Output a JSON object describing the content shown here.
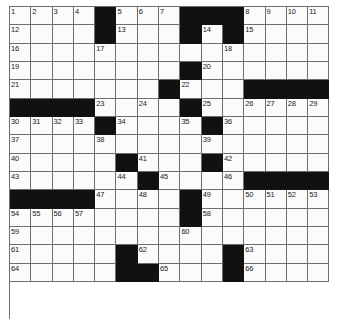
{
  "puzzle": {
    "title": "Crossword Grid",
    "columns": 15,
    "rows": 17,
    "colors": {
      "block": "#111111",
      "cell": "#fbfbfb",
      "gridline": "#6e6e6e",
      "number": "#1a1a1a",
      "background": "#ffffff"
    },
    "grid": [
      {
        "row": 1,
        "cells": [
          {
            "type": "open",
            "number": "1"
          },
          {
            "type": "open",
            "number": "2"
          },
          {
            "type": "open",
            "number": "3"
          },
          {
            "type": "open",
            "number": "4"
          },
          {
            "type": "block",
            "number": ""
          },
          {
            "type": "open",
            "number": "5"
          },
          {
            "type": "open",
            "number": "6"
          },
          {
            "type": "open",
            "number": "7"
          },
          {
            "type": "block",
            "number": ""
          },
          {
            "type": "block",
            "number": ""
          },
          {
            "type": "block",
            "number": ""
          },
          {
            "type": "open",
            "number": "8"
          },
          {
            "type": "open",
            "number": "9"
          },
          {
            "type": "open",
            "number": "10"
          },
          {
            "type": "open",
            "number": "11"
          }
        ]
      },
      {
        "row": 2,
        "cells": [
          {
            "type": "open",
            "number": "12"
          },
          {
            "type": "open",
            "number": ""
          },
          {
            "type": "open",
            "number": ""
          },
          {
            "type": "open",
            "number": ""
          },
          {
            "type": "block",
            "number": ""
          },
          {
            "type": "open",
            "number": "13"
          },
          {
            "type": "open",
            "number": ""
          },
          {
            "type": "open",
            "number": ""
          },
          {
            "type": "block",
            "number": ""
          },
          {
            "type": "open",
            "number": "14"
          },
          {
            "type": "block",
            "number": ""
          },
          {
            "type": "open",
            "number": "15"
          },
          {
            "type": "open",
            "number": ""
          },
          {
            "type": "open",
            "number": ""
          },
          {
            "type": "open",
            "number": ""
          }
        ]
      },
      {
        "row": 3,
        "cells": [
          {
            "type": "open",
            "number": "16"
          },
          {
            "type": "open",
            "number": ""
          },
          {
            "type": "open",
            "number": ""
          },
          {
            "type": "open",
            "number": ""
          },
          {
            "type": "open",
            "number": "17"
          },
          {
            "type": "open",
            "number": ""
          },
          {
            "type": "open",
            "number": ""
          },
          {
            "type": "open",
            "number": ""
          },
          {
            "type": "open",
            "number": ""
          },
          {
            "type": "open",
            "number": ""
          },
          {
            "type": "open",
            "number": "18"
          },
          {
            "type": "open",
            "number": ""
          },
          {
            "type": "open",
            "number": ""
          },
          {
            "type": "open",
            "number": ""
          },
          {
            "type": "open",
            "number": ""
          }
        ]
      },
      {
        "row": 4,
        "cells": [
          {
            "type": "open",
            "number": "19"
          },
          {
            "type": "open",
            "number": ""
          },
          {
            "type": "open",
            "number": ""
          },
          {
            "type": "open",
            "number": ""
          },
          {
            "type": "open",
            "number": ""
          },
          {
            "type": "open",
            "number": ""
          },
          {
            "type": "open",
            "number": ""
          },
          {
            "type": "open",
            "number": ""
          },
          {
            "type": "block",
            "number": ""
          },
          {
            "type": "open",
            "number": "20"
          },
          {
            "type": "open",
            "number": ""
          },
          {
            "type": "open",
            "number": ""
          },
          {
            "type": "open",
            "number": ""
          },
          {
            "type": "open",
            "number": ""
          },
          {
            "type": "open",
            "number": ""
          }
        ]
      },
      {
        "row": 5,
        "cells": [
          {
            "type": "open",
            "number": "21"
          },
          {
            "type": "open",
            "number": ""
          },
          {
            "type": "open",
            "number": ""
          },
          {
            "type": "open",
            "number": ""
          },
          {
            "type": "open",
            "number": ""
          },
          {
            "type": "open",
            "number": ""
          },
          {
            "type": "open",
            "number": ""
          },
          {
            "type": "block",
            "number": ""
          },
          {
            "type": "open",
            "number": "22"
          },
          {
            "type": "open",
            "number": ""
          },
          {
            "type": "open",
            "number": ""
          },
          {
            "type": "block",
            "number": ""
          },
          {
            "type": "block",
            "number": ""
          },
          {
            "type": "block",
            "number": ""
          },
          {
            "type": "block",
            "number": ""
          }
        ]
      },
      {
        "row": 6,
        "cells": [
          {
            "type": "block",
            "number": ""
          },
          {
            "type": "block",
            "number": ""
          },
          {
            "type": "block",
            "number": ""
          },
          {
            "type": "block",
            "number": ""
          },
          {
            "type": "open",
            "number": "23"
          },
          {
            "type": "open",
            "number": ""
          },
          {
            "type": "open",
            "number": "24"
          },
          {
            "type": "open",
            "number": ""
          },
          {
            "type": "block",
            "number": ""
          },
          {
            "type": "open",
            "number": "25"
          },
          {
            "type": "open",
            "number": ""
          },
          {
            "type": "open",
            "number": "26"
          },
          {
            "type": "open",
            "number": "27"
          },
          {
            "type": "open",
            "number": "28"
          },
          {
            "type": "open",
            "number": "29"
          }
        ]
      },
      {
        "row": 7,
        "cells": [
          {
            "type": "open",
            "number": "30"
          },
          {
            "type": "open",
            "number": "31"
          },
          {
            "type": "open",
            "number": "32"
          },
          {
            "type": "open",
            "number": "33"
          },
          {
            "type": "block",
            "number": ""
          },
          {
            "type": "open",
            "number": "34"
          },
          {
            "type": "open",
            "number": ""
          },
          {
            "type": "open",
            "number": ""
          },
          {
            "type": "open",
            "number": "35"
          },
          {
            "type": "block",
            "number": ""
          },
          {
            "type": "open",
            "number": "36"
          },
          {
            "type": "open",
            "number": ""
          },
          {
            "type": "open",
            "number": ""
          },
          {
            "type": "open",
            "number": ""
          },
          {
            "type": "open",
            "number": ""
          }
        ]
      },
      {
        "row": 8,
        "cells": [
          {
            "type": "open",
            "number": "37"
          },
          {
            "type": "open",
            "number": ""
          },
          {
            "type": "open",
            "number": ""
          },
          {
            "type": "open",
            "number": ""
          },
          {
            "type": "open",
            "number": "38"
          },
          {
            "type": "open",
            "number": ""
          },
          {
            "type": "open",
            "number": ""
          },
          {
            "type": "open",
            "number": ""
          },
          {
            "type": "open",
            "number": ""
          },
          {
            "type": "open",
            "number": "39"
          },
          {
            "type": "open",
            "number": ""
          },
          {
            "type": "open",
            "number": ""
          },
          {
            "type": "open",
            "number": ""
          },
          {
            "type": "open",
            "number": ""
          },
          {
            "type": "open",
            "number": ""
          }
        ]
      },
      {
        "row": 9,
        "cells": [
          {
            "type": "open",
            "number": "40"
          },
          {
            "type": "open",
            "number": ""
          },
          {
            "type": "open",
            "number": ""
          },
          {
            "type": "open",
            "number": ""
          },
          {
            "type": "open",
            "number": ""
          },
          {
            "type": "block",
            "number": ""
          },
          {
            "type": "open",
            "number": "41"
          },
          {
            "type": "open",
            "number": ""
          },
          {
            "type": "open",
            "number": ""
          },
          {
            "type": "block",
            "number": ""
          },
          {
            "type": "open",
            "number": "42"
          },
          {
            "type": "open",
            "number": ""
          },
          {
            "type": "open",
            "number": ""
          },
          {
            "type": "open",
            "number": ""
          },
          {
            "type": "open",
            "number": ""
          }
        ]
      },
      {
        "row": 10,
        "cells": [
          {
            "type": "open",
            "number": "43"
          },
          {
            "type": "open",
            "number": ""
          },
          {
            "type": "open",
            "number": ""
          },
          {
            "type": "open",
            "number": ""
          },
          {
            "type": "open",
            "number": ""
          },
          {
            "type": "open",
            "number": "44"
          },
          {
            "type": "block",
            "number": ""
          },
          {
            "type": "open",
            "number": "45"
          },
          {
            "type": "open",
            "number": ""
          },
          {
            "type": "open",
            "number": ""
          },
          {
            "type": "open",
            "number": "46"
          },
          {
            "type": "block",
            "number": ""
          },
          {
            "type": "block",
            "number": ""
          },
          {
            "type": "block",
            "number": ""
          },
          {
            "type": "block",
            "number": ""
          }
        ]
      },
      {
        "row": 11,
        "cells": [
          {
            "type": "block",
            "number": ""
          },
          {
            "type": "block",
            "number": ""
          },
          {
            "type": "block",
            "number": ""
          },
          {
            "type": "block",
            "number": ""
          },
          {
            "type": "open",
            "number": "47"
          },
          {
            "type": "open",
            "number": ""
          },
          {
            "type": "open",
            "number": "48"
          },
          {
            "type": "open",
            "number": ""
          },
          {
            "type": "block",
            "number": ""
          },
          {
            "type": "open",
            "number": "49"
          },
          {
            "type": "open",
            "number": ""
          },
          {
            "type": "open",
            "number": "50"
          },
          {
            "type": "open",
            "number": "51"
          },
          {
            "type": "open",
            "number": "52"
          },
          {
            "type": "open",
            "number": "53"
          }
        ]
      },
      {
        "row": 12,
        "cells": [
          {
            "type": "open",
            "number": "54"
          },
          {
            "type": "open",
            "number": "55"
          },
          {
            "type": "open",
            "number": "56"
          },
          {
            "type": "open",
            "number": "57"
          },
          {
            "type": "open",
            "number": ""
          },
          {
            "type": "open",
            "number": ""
          },
          {
            "type": "open",
            "number": ""
          },
          {
            "type": "open",
            "number": ""
          },
          {
            "type": "block",
            "number": ""
          },
          {
            "type": "open",
            "number": "58"
          },
          {
            "type": "open",
            "number": ""
          },
          {
            "type": "open",
            "number": ""
          },
          {
            "type": "open",
            "number": ""
          },
          {
            "type": "open",
            "number": ""
          },
          {
            "type": "open",
            "number": ""
          }
        ]
      },
      {
        "row": 13,
        "cells": [
          {
            "type": "open",
            "number": "59"
          },
          {
            "type": "open",
            "number": ""
          },
          {
            "type": "open",
            "number": ""
          },
          {
            "type": "open",
            "number": ""
          },
          {
            "type": "open",
            "number": ""
          },
          {
            "type": "open",
            "number": ""
          },
          {
            "type": "open",
            "number": ""
          },
          {
            "type": "open",
            "number": ""
          },
          {
            "type": "open",
            "number": "60"
          },
          {
            "type": "open",
            "number": ""
          },
          {
            "type": "open",
            "number": ""
          },
          {
            "type": "open",
            "number": ""
          },
          {
            "type": "open",
            "number": ""
          },
          {
            "type": "open",
            "number": ""
          },
          {
            "type": "open",
            "number": ""
          }
        ]
      },
      {
        "row": 14,
        "cells": [
          {
            "type": "open",
            "number": "61"
          },
          {
            "type": "open",
            "number": ""
          },
          {
            "type": "open",
            "number": ""
          },
          {
            "type": "open",
            "number": ""
          },
          {
            "type": "open",
            "number": ""
          },
          {
            "type": "block",
            "number": ""
          },
          {
            "type": "open",
            "number": "62"
          },
          {
            "type": "open",
            "number": ""
          },
          {
            "type": "open",
            "number": ""
          },
          {
            "type": "open",
            "number": ""
          },
          {
            "type": "block",
            "number": ""
          },
          {
            "type": "open",
            "number": "63"
          },
          {
            "type": "open",
            "number": ""
          },
          {
            "type": "open",
            "number": ""
          },
          {
            "type": "open",
            "number": ""
          }
        ]
      },
      {
        "row": 15,
        "cells": [
          {
            "type": "open",
            "number": "64"
          },
          {
            "type": "open",
            "number": ""
          },
          {
            "type": "open",
            "number": ""
          },
          {
            "type": "open",
            "number": ""
          },
          {
            "type": "open",
            "number": ""
          },
          {
            "type": "block",
            "number": ""
          },
          {
            "type": "block",
            "number": ""
          },
          {
            "type": "open",
            "number": "65"
          },
          {
            "type": "open",
            "number": ""
          },
          {
            "type": "open",
            "number": ""
          },
          {
            "type": "block",
            "number": ""
          },
          {
            "type": "open",
            "number": "66"
          },
          {
            "type": "open",
            "number": ""
          },
          {
            "type": "open",
            "number": ""
          },
          {
            "type": "open",
            "number": ""
          }
        ]
      }
    ]
  }
}
